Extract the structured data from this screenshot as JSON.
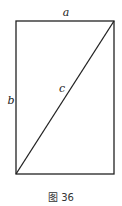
{
  "figure": {
    "caption": "图 36",
    "labels": {
      "top": "a",
      "left": "b",
      "diagonal": "c"
    },
    "shape": "rectangle with diagonal from bottom-left to top-right",
    "stroke_color": "#222222"
  }
}
